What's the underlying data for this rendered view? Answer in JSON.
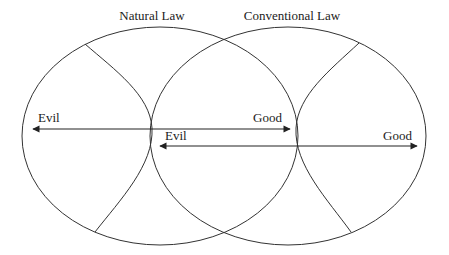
{
  "diagram": {
    "circles": [
      {
        "id": "natural",
        "label": "Natural Law"
      },
      {
        "id": "conventional",
        "label": "Conventional Law"
      }
    ],
    "arrows": [
      {
        "id": "natural-axis",
        "left_label": "Evil",
        "right_label": "Good"
      },
      {
        "id": "conventional-axis",
        "left_label": "Evil",
        "right_label": "Good"
      }
    ],
    "colors": {
      "stroke": "#333333",
      "background": "#ffffff"
    }
  }
}
